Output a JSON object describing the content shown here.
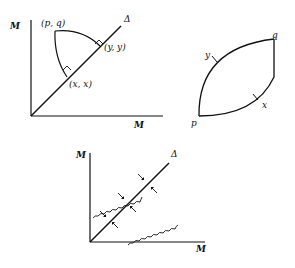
{
  "figures": [
    {
      "id": "top-left",
      "axis_y_label": "M",
      "axis_x_label": "M",
      "diagonal_label": "Δ",
      "point_labels": [
        "(p, q)",
        "(y, y)",
        "(x, x)"
      ]
    },
    {
      "id": "top-right",
      "point_labels": [
        "p",
        "q",
        "y",
        "x"
      ]
    },
    {
      "id": "bottom",
      "axis_y_label": "M",
      "axis_x_label": "M",
      "diagonal_label": "Δ"
    }
  ]
}
